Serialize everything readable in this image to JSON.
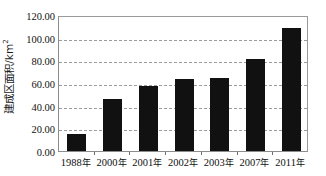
{
  "chart_data": {
    "type": "bar",
    "title": "",
    "xlabel": "",
    "ylabel": "建成区面积/km²",
    "ylabel_text": "建成区面积/km",
    "ylabel_superscript": "2",
    "categories": [
      "1988年",
      "2000年",
      "2001年",
      "2002年",
      "2003年",
      "2007年",
      "2011年"
    ],
    "values": [
      15.0,
      45.5,
      57.0,
      63.5,
      64.0,
      81.5,
      108.5
    ],
    "ylim": [
      0,
      120
    ],
    "ytick_values": [
      0,
      20,
      40,
      60,
      80,
      100,
      120
    ],
    "ytick_labels": [
      "0.00",
      "20.00",
      "40.00",
      "60.00",
      "80.00",
      "100.00",
      "120.00"
    ],
    "grid": true,
    "grid_style": "dashed",
    "legend": "none",
    "bar_color": "#111111",
    "gridline_color": "#9b9b9b",
    "axis_color": "#8c8c8c",
    "background_color": "#ffffff"
  }
}
